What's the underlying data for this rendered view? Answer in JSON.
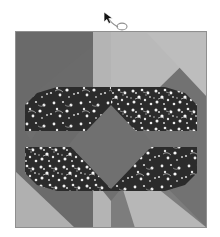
{
  "scene": {
    "title": "Origami crease pattern square",
    "width": 220,
    "height": 237,
    "background_color": "#ffffff"
  },
  "artwork": {
    "name": "tessellated-square-figure",
    "left": 15,
    "top": 31,
    "width": 192,
    "height": 197,
    "base_color": "#6e6e6e",
    "highlight_color": "#b9b9b9",
    "mid_color": "#7a7a7a",
    "shadow_color": "#636363",
    "dark_texture_color": "#2b2b2b",
    "speckle_color": "#f2f2f2",
    "border_color": "#8a8a8a",
    "regions": [
      {
        "name": "background-panel",
        "shape": "rect",
        "color": "#6e6e6e",
        "label": "Base square panel"
      },
      {
        "name": "top-light-wedge",
        "shape": "triangle",
        "color": "#b9b9b9",
        "label": "Upper light triangular wedge"
      },
      {
        "name": "bottom-light-wedge",
        "shape": "triangle",
        "color": "#b9b9b9",
        "label": "Lower light triangular wedge"
      },
      {
        "name": "center-diamond",
        "shape": "diamond",
        "color": "#707070",
        "label": "Central gray diamond"
      },
      {
        "name": "upper-dark-band",
        "shape": "polygon",
        "color": "#2b2b2b",
        "label": "Upper dark speckled band"
      },
      {
        "name": "lower-dark-band",
        "shape": "polygon",
        "color": "#2b2b2b",
        "label": "Lower dark speckled band"
      }
    ]
  },
  "cursor": {
    "name": "mouse-pointer-with-lasso",
    "left": 98,
    "top": 10,
    "arrow_color": "#111111",
    "trail_color": "#9a9a9a",
    "label": "Pointer"
  }
}
